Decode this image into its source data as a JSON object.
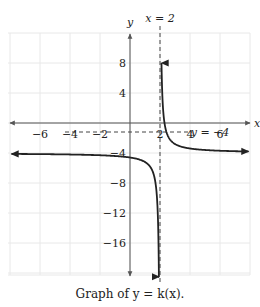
{
  "chart_data": {
    "type": "line",
    "title": "",
    "caption": "Graph of y = k(x).",
    "xlabel": "x",
    "ylabel": "y",
    "xlim": [
      -8.1,
      8
    ],
    "ylim": [
      -20.3,
      12
    ],
    "grid": true,
    "x_ticks": [
      -6,
      -4,
      -2,
      2,
      4,
      6
    ],
    "y_ticks": [
      8,
      4,
      -4,
      -8,
      -12,
      -16
    ],
    "x_tick_labels": [
      "−6",
      "−4",
      "−2",
      "2",
      "4",
      "6"
    ],
    "y_tick_labels": [
      "8",
      "4",
      "−4",
      "−8",
      "−12",
      "−16"
    ],
    "asymptotes": [
      {
        "type": "vertical",
        "x": 2,
        "label": "x = 2"
      },
      {
        "type": "horizontal",
        "y": -4,
        "label": "y = −4"
      }
    ],
    "function": {
      "name": "k(x)",
      "form": "-4 + 1.2/(x - 2)"
    },
    "series": [
      {
        "name": "k(x) left branch",
        "x": [
          -8,
          -6,
          -4,
          -2,
          0,
          1,
          1.5,
          1.8,
          1.9,
          1.94
        ],
        "y": [
          -4.12,
          -4.15,
          -4.2,
          -4.3,
          -4.6,
          -5.2,
          -6.4,
          -10,
          -16,
          -20
        ]
      },
      {
        "name": "k(x) right branch",
        "x": [
          2.1,
          2.15,
          2.3,
          2.5,
          3,
          4,
          6,
          8
        ],
        "y": [
          8,
          4,
          0,
          -1.6,
          -2.8,
          -3.4,
          -3.7,
          -3.8
        ]
      }
    ]
  }
}
